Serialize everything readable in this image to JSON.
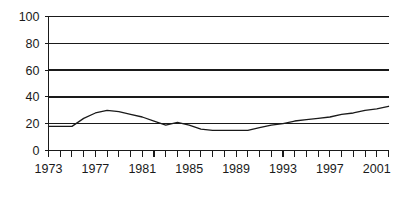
{
  "chart_data": {
    "type": "line",
    "title": "",
    "subtitle": "",
    "xlabel": "",
    "ylabel": "",
    "grid": true,
    "legend": false,
    "legend_position": "none",
    "line_color": "#1a1a1a",
    "axis_color": "#1a1a1a",
    "background": "#ffffff",
    "xlim": [
      1973,
      2002
    ],
    "ylim": [
      0,
      100
    ],
    "y_ticks": [
      0,
      20,
      40,
      60,
      80,
      100
    ],
    "y_tick_labels": [
      "0",
      "20",
      "40",
      "60",
      "80",
      "100"
    ],
    "x_ticks": [
      1973,
      1974,
      1975,
      1976,
      1977,
      1978,
      1979,
      1980,
      1981,
      1982,
      1983,
      1984,
      1985,
      1986,
      1987,
      1988,
      1989,
      1990,
      1991,
      1992,
      1993,
      1994,
      1995,
      1996,
      1997,
      1998,
      1999,
      2000,
      2001,
      2002
    ],
    "x_tick_labels": [
      "1973",
      "1977",
      "1981",
      "1985",
      "1989",
      "1993",
      "1997",
      "2001"
    ],
    "x_labeled_ticks": [
      1973,
      1977,
      1981,
      1985,
      1989,
      1993,
      1997,
      2001
    ],
    "x": [
      1973,
      1974,
      1975,
      1976,
      1977,
      1978,
      1979,
      1980,
      1981,
      1982,
      1983,
      1984,
      1985,
      1986,
      1987,
      1988,
      1989,
      1990,
      1991,
      1992,
      1993,
      1994,
      1995,
      1996,
      1997,
      1998,
      1999,
      2000,
      2001,
      2002
    ],
    "values": [
      18,
      18,
      18,
      24,
      28,
      30,
      29,
      27,
      25,
      22,
      19,
      21,
      19,
      16,
      15,
      15,
      15,
      15,
      17,
      19,
      20,
      22,
      23,
      24,
      25,
      27,
      28,
      30,
      31,
      33
    ],
    "series": [
      {
        "name": "series-1",
        "color": "#1a1a1a",
        "values": [
          18,
          18,
          18,
          24,
          28,
          30,
          29,
          27,
          25,
          22,
          19,
          21,
          19,
          16,
          15,
          15,
          15,
          15,
          17,
          19,
          20,
          22,
          23,
          24,
          25,
          27,
          28,
          30,
          31,
          33
        ]
      }
    ]
  }
}
